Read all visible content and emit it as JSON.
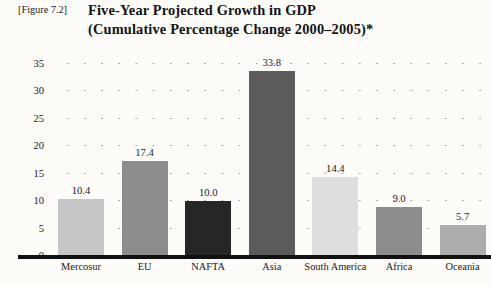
{
  "figure": {
    "tag": "[Figure 7.2]",
    "title_line1": "Five-Year Projected Growth in GDP",
    "title_line2": "(Cumulative Percentage Change 2000–2005)*"
  },
  "chart_data": {
    "type": "bar",
    "title": "Five-Year Projected Growth in GDP (Cumulative Percentage Change 2000–2005)*",
    "xlabel": "",
    "ylabel": "",
    "ylim": [
      0,
      35
    ],
    "yticks": [
      "0",
      "5",
      "10",
      "15",
      "20",
      "25",
      "30",
      "35"
    ],
    "grid": true,
    "grid_style": "dotted",
    "legend": "none",
    "categories": [
      "Mercosur",
      "EU",
      "NAFTA",
      "Asia",
      "South America",
      "Africa",
      "Oceania"
    ],
    "values": [
      10.4,
      17.4,
      10.0,
      33.8,
      14.4,
      9.0,
      5.7
    ],
    "value_labels": [
      "10.4",
      "17.4",
      "10.0",
      "33.8",
      "14.4",
      "9.0",
      "5.7"
    ],
    "bar_colors": [
      "#c6c6c6",
      "#8d8d8d",
      "#262626",
      "#5b5b5b",
      "#dedede",
      "#8d8d8d",
      "#acacac"
    ]
  },
  "colors": {
    "page_background": "#fdfcf9",
    "axis": "#111111",
    "text": "#1b1b1b",
    "gridline": "#9a9a9a"
  }
}
